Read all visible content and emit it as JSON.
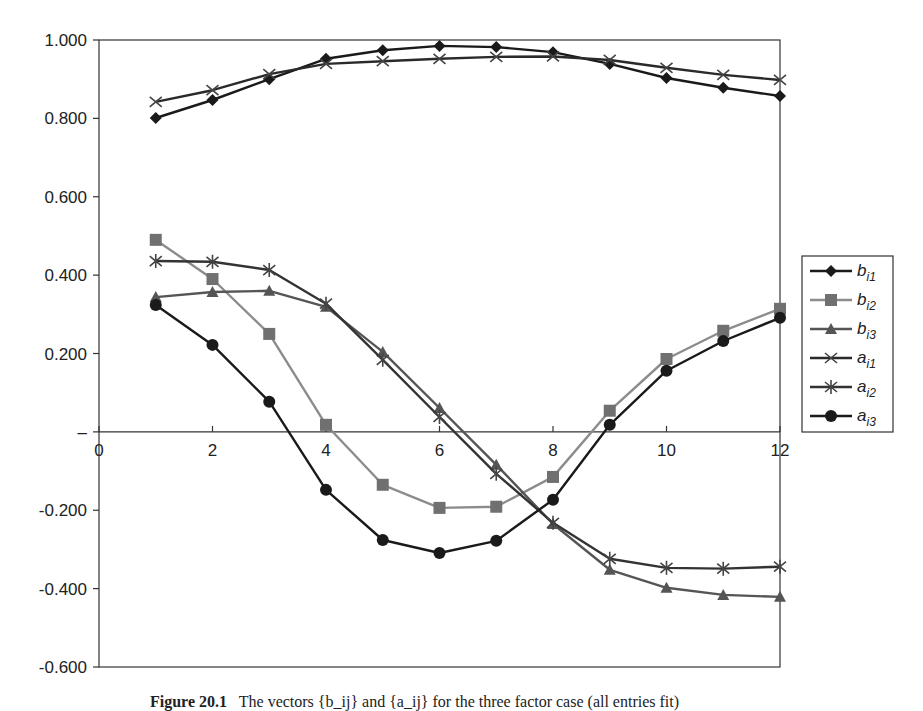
{
  "chart_data": {
    "type": "line",
    "title": "",
    "xlabel": "",
    "ylabel": "",
    "x": [
      1,
      2,
      3,
      4,
      5,
      6,
      7,
      8,
      9,
      10,
      11,
      12
    ],
    "xlim": [
      0,
      12
    ],
    "ylim": [
      -0.6,
      1.0
    ],
    "x_ticks": [
      0,
      2,
      4,
      6,
      8,
      10,
      12
    ],
    "x_tick_labels": [
      "0",
      "2",
      "4",
      "6",
      "8",
      "10",
      "12"
    ],
    "y_ticks": [
      1.0,
      0.8,
      0.6,
      0.4,
      0.2,
      0.0,
      -0.2,
      -0.4,
      -0.6
    ],
    "y_tick_labels": [
      "1.000",
      "0.800",
      "0.600",
      "0.400",
      "0.200",
      "–",
      "-0.200",
      "-0.400",
      "-0.600"
    ],
    "grid": false,
    "legend_position": "right",
    "series": [
      {
        "name": "b_i1",
        "label_base": "b",
        "label_sub": "i1",
        "marker": "diamond",
        "line_color": "#1a1a1a",
        "marker_color": "#1a1a1a",
        "values": [
          0.801,
          0.847,
          0.9,
          0.952,
          0.974,
          0.985,
          0.982,
          0.969,
          0.939,
          0.903,
          0.878,
          0.857
        ]
      },
      {
        "name": "b_i2",
        "label_base": "b",
        "label_sub": "i2",
        "marker": "square",
        "line_color": "#8c8c8c",
        "marker_color": "#707070",
        "values": [
          0.49,
          0.39,
          0.25,
          0.018,
          -0.135,
          -0.194,
          -0.191,
          -0.115,
          0.054,
          0.186,
          0.258,
          0.314
        ]
      },
      {
        "name": "b_i3",
        "label_base": "b",
        "label_sub": "i3",
        "marker": "triangle",
        "line_color": "#555555",
        "marker_color": "#555555",
        "values": [
          0.344,
          0.357,
          0.36,
          0.319,
          0.204,
          0.061,
          -0.084,
          -0.235,
          -0.352,
          -0.398,
          -0.416,
          -0.421
        ]
      },
      {
        "name": "a_i1",
        "label_base": "a",
        "label_sub": "i1",
        "marker": "x",
        "line_color": "#2a2a2a",
        "marker_color": "#444444",
        "values": [
          0.842,
          0.872,
          0.913,
          0.939,
          0.946,
          0.952,
          0.957,
          0.958,
          0.949,
          0.929,
          0.911,
          0.898
        ]
      },
      {
        "name": "a_i2",
        "label_base": "a",
        "label_sub": "i2",
        "marker": "asterisk",
        "line_color": "#333333",
        "marker_color": "#444444",
        "values": [
          0.436,
          0.434,
          0.413,
          0.327,
          0.184,
          0.038,
          -0.107,
          -0.232,
          -0.324,
          -0.347,
          -0.349,
          -0.344
        ]
      },
      {
        "name": "a_i3",
        "label_base": "a",
        "label_sub": "i3",
        "marker": "circle",
        "line_color": "#1a1a1a",
        "marker_color": "#1a1a1a",
        "values": [
          0.324,
          0.222,
          0.077,
          -0.148,
          -0.276,
          -0.309,
          -0.278,
          -0.173,
          0.018,
          0.156,
          0.232,
          0.291
        ]
      }
    ]
  },
  "caption": {
    "label": "Figure 20.1",
    "text": "The vectors {b_ij} and {a_ij} for the three factor case (all entries fit)"
  }
}
